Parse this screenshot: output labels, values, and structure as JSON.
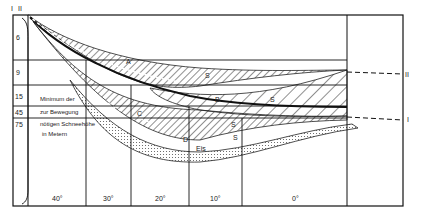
{
  "diagram": {
    "top_labels": {
      "i": "I",
      "ii": "II"
    },
    "right_labels": {
      "ii": "II",
      "i": "I"
    },
    "depth_rows": [
      "6",
      "9",
      "15",
      "45",
      "75"
    ],
    "note_lines": [
      "Minimum der",
      "zur Bewegung",
      "nötigen Schneehöhe",
      "in Metern"
    ],
    "slope_columns": [
      "40°",
      "30°",
      "20°",
      "10°",
      "0°"
    ],
    "zone_labels": {
      "a": "A",
      "s1": "S",
      "b": "B",
      "s2": "S",
      "c": "C",
      "s3": "S",
      "d": "D",
      "s4": "S",
      "eis": "Eis"
    },
    "colors": {
      "line": "#1a1a1a",
      "background": "#ffffff",
      "dots": "#555555"
    }
  }
}
